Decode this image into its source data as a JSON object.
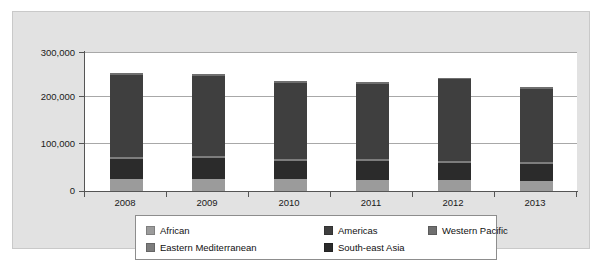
{
  "chart_data": {
    "type": "bar",
    "subtype": "stacked-vertical",
    "title": "",
    "subtitle": "",
    "xlabel": "",
    "ylabel": "",
    "categories": [
      "2008",
      "2009",
      "2010",
      "2011",
      "2012",
      "2013"
    ],
    "ylim": [
      0,
      300000
    ],
    "ytick_values": [
      0,
      100000,
      200000,
      300000
    ],
    "ytick_labels": [
      "0",
      "100,000",
      "200,000",
      "300,000"
    ],
    "grid": true,
    "grid_axis": "y",
    "legend_position": "bottom",
    "series": [
      {
        "name": "African",
        "color": "#9b9b9b",
        "values": [
          26000,
          26000,
          25000,
          24000,
          23000,
          22000
        ]
      },
      {
        "name": "South-east Asia",
        "color": "#2b2b2b",
        "values": [
          44000,
          45000,
          40000,
          41000,
          38000,
          36000
        ]
      },
      {
        "name": "Eastern Mediterranean",
        "color": "#7d7d7d",
        "values": [
          4000,
          4000,
          4000,
          4000,
          4000,
          4000
        ]
      },
      {
        "name": "Americas",
        "color": "#3f3f3f",
        "values": [
          177000,
          174000,
          165000,
          163000,
          176000,
          159000
        ]
      },
      {
        "name": "Western Pacific",
        "color": "#6f6f6f",
        "values": [
          4000,
          4000,
          4000,
          4000,
          4000,
          4000
        ]
      }
    ],
    "totals": [
      255000,
      253000,
      238000,
      236000,
      245000,
      225000
    ]
  },
  "legend": {
    "items": [
      {
        "label": "African",
        "swatch_color": "#9b9b9b"
      },
      {
        "label": "Americas",
        "swatch_color": "#3f3f3f"
      },
      {
        "label": "Western Pacific",
        "swatch_color": "#6f6f6f"
      },
      {
        "label": "Eastern Mediterranean",
        "swatch_color": "#7d7d7d"
      },
      {
        "label": "South-east Asia",
        "swatch_color": "#2b2b2b"
      }
    ]
  },
  "colors": {
    "panel_background": "#e2e2e2",
    "plot_background": "#ffffff",
    "axis": "#555555",
    "gridline": "#a8a8a8",
    "text": "#1a1a1a"
  }
}
